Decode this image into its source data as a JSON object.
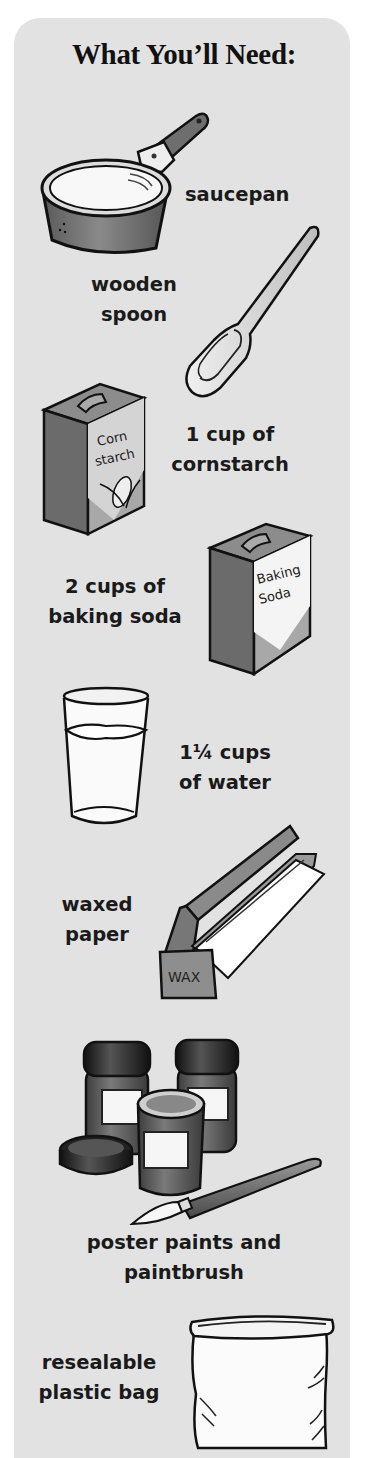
{
  "header": {
    "title": "What You’ll Need:"
  },
  "items": [
    {
      "id": "saucepan",
      "label_lines": [
        "saucepan"
      ],
      "icon": "saucepan-icon"
    },
    {
      "id": "wooden-spoon",
      "label_lines": [
        "wooden",
        "spoon"
      ],
      "icon": "wooden-spoon-icon"
    },
    {
      "id": "cornstarch",
      "label_lines": [
        "1 cup of",
        "cornstarch"
      ],
      "icon": "cornstarch-box-icon",
      "box_text": [
        "Corn",
        "starch"
      ]
    },
    {
      "id": "baking-soda",
      "label_lines": [
        "2 cups of",
        "baking soda"
      ],
      "icon": "baking-soda-box-icon",
      "box_text": [
        "Baking",
        "Soda"
      ]
    },
    {
      "id": "water",
      "label_lines": [
        "1¼ cups",
        "of water"
      ],
      "icon": "water-glass-icon"
    },
    {
      "id": "waxed-paper",
      "label_lines": [
        "waxed",
        "paper"
      ],
      "icon": "waxed-paper-box-icon",
      "box_text": [
        "WAX"
      ]
    },
    {
      "id": "poster-paints",
      "label_lines": [
        "poster paints and",
        "paintbrush"
      ],
      "icon": "paint-jars-and-brush-icon"
    },
    {
      "id": "plastic-bag",
      "label_lines": [
        "resealable",
        "plastic bag"
      ],
      "icon": "plastic-bag-icon"
    }
  ],
  "colors": {
    "panel_background": "#e2e2e2",
    "page_background": "#ffffff",
    "text": "#1a1a1a"
  }
}
